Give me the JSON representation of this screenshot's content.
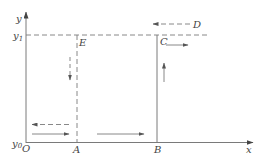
{
  "diagram": {
    "type": "coordinate-path-diagram",
    "colors": {
      "line": "#7a7a7a",
      "text": "#444444",
      "background": "#ffffff"
    },
    "axes": {
      "x_label": "x",
      "y_label": "y",
      "origin_label": "O",
      "y0_label": "y",
      "y0_sub": "0",
      "y1_label": "y",
      "y1_sub": "1"
    },
    "points": {
      "A": "A",
      "B": "B",
      "C": "C",
      "D": "D",
      "E": "E"
    },
    "lines": [
      {
        "id": "y1-level",
        "style": "dashed",
        "description": "horizontal dashed line at y1"
      },
      {
        "id": "E-to-A",
        "style": "dashed",
        "description": "vertical dashed line from E down to A"
      },
      {
        "id": "B-to-C",
        "style": "solid",
        "description": "vertical solid line from B up to C"
      }
    ],
    "arrows": [
      {
        "id": "arrow-D-left",
        "style": "dashed",
        "direction": "left"
      },
      {
        "id": "arrow-C-right",
        "style": "solid",
        "direction": "right"
      },
      {
        "id": "arrow-BC-up",
        "style": "solid",
        "direction": "up"
      },
      {
        "id": "arrow-E-down",
        "style": "dashed",
        "direction": "down"
      },
      {
        "id": "arrow-OA-left",
        "style": "dashed",
        "direction": "left"
      },
      {
        "id": "arrow-OA-right",
        "style": "solid",
        "direction": "right"
      },
      {
        "id": "arrow-AB-right",
        "style": "solid",
        "direction": "right"
      }
    ]
  }
}
